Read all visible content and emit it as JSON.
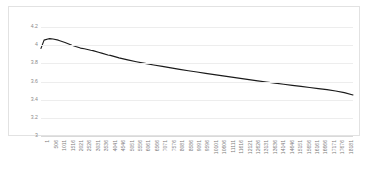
{
  "chart_data": {
    "type": "line",
    "title": "",
    "xlabel": "",
    "ylabel": "",
    "ylim": [
      3,
      4.2
    ],
    "yticks": [
      "3",
      "3.2",
      "3.4",
      "3.6",
      "3.8",
      "4",
      "4.2"
    ],
    "ytick_values": [
      3,
      3.2,
      3.4,
      3.6,
      3.8,
      4,
      4.2
    ],
    "grid": "horizontal",
    "legend": "none",
    "line_color": "#1a1a1a",
    "grid_color": "#ededed",
    "border_color": "#e2e2e2",
    "label_color": "#8a8a8a",
    "xtick_step": 505,
    "xticks": [
      "1",
      "506",
      "1011",
      "1516",
      "2021",
      "2526",
      "3031",
      "3536",
      "4041",
      "4546",
      "5051",
      "5556",
      "6061",
      "6566",
      "7071",
      "7576",
      "8081",
      "8586",
      "9091",
      "9596",
      "10101",
      "10606",
      "11111",
      "11616",
      "12121",
      "12626",
      "13131",
      "13636",
      "14141",
      "14646",
      "15151",
      "15656",
      "16161",
      "16666",
      "17171",
      "17676",
      "18181"
    ],
    "x": [
      1,
      180,
      400,
      506,
      700,
      1011,
      1400,
      1800,
      2021,
      2300,
      2526,
      2900,
      3031,
      3400,
      3536,
      3900,
      4041,
      4400,
      4546,
      5051,
      5556,
      6061,
      6566,
      7071,
      7576,
      8081,
      8586,
      9091,
      9596,
      10101,
      10606,
      11111,
      11616,
      12121,
      12626,
      13131,
      13636,
      14141,
      14646,
      15151,
      15656,
      16161,
      16666,
      17171,
      17676,
      18181
    ],
    "values": [
      3.965,
      4.055,
      4.068,
      4.072,
      4.068,
      4.055,
      4.03,
      4.0,
      3.985,
      3.968,
      3.96,
      3.944,
      3.94,
      3.92,
      3.912,
      3.892,
      3.888,
      3.868,
      3.86,
      3.838,
      3.818,
      3.8,
      3.782,
      3.766,
      3.75,
      3.734,
      3.718,
      3.704,
      3.69,
      3.676,
      3.662,
      3.648,
      3.634,
      3.62,
      3.607,
      3.594,
      3.582,
      3.57,
      3.558,
      3.546,
      3.534,
      3.522,
      3.51,
      3.495,
      3.478,
      3.452
    ],
    "xlim": [
      1,
      18181
    ]
  }
}
